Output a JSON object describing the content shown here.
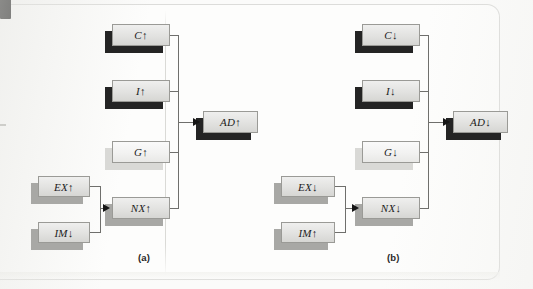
{
  "figure": {
    "type": "flow-diagram",
    "panels": [
      {
        "id": "a",
        "caption": "(a)",
        "component_nodes": [
          {
            "id": "c-up",
            "label": "C↑",
            "shade": "dark"
          },
          {
            "id": "i-up",
            "label": "I↑",
            "shade": "dark"
          },
          {
            "id": "g-up",
            "label": "G↑",
            "shade": "light"
          },
          {
            "id": "nx-up",
            "label": "NX↑",
            "shade": "mid"
          }
        ],
        "input_nodes": [
          {
            "id": "ex-up",
            "label": "EX↑",
            "shade": "mid"
          },
          {
            "id": "im-dn",
            "label": "IM↓",
            "shade": "mid"
          }
        ],
        "output_node": {
          "id": "ad-up",
          "label": "AD↑",
          "shade": "dark"
        }
      },
      {
        "id": "b",
        "caption": "(b)",
        "component_nodes": [
          {
            "id": "c-dn",
            "label": "C↓",
            "shade": "dark"
          },
          {
            "id": "i-dn",
            "label": "I↓",
            "shade": "dark"
          },
          {
            "id": "g-dn",
            "label": "G↓",
            "shade": "light"
          },
          {
            "id": "nx-dn",
            "label": "NX↓",
            "shade": "mid"
          }
        ],
        "input_nodes": [
          {
            "id": "ex-dn",
            "label": "EX↓",
            "shade": "mid"
          },
          {
            "id": "im-up",
            "label": "IM↑",
            "shade": "mid"
          }
        ],
        "output_node": {
          "id": "ad-dn",
          "label": "AD↓",
          "shade": "dark"
        }
      }
    ],
    "colors": {
      "paper": "#fdfdfc",
      "box_face": "#e6e6e4",
      "box_shadow_dark": "#242424",
      "box_shadow_mid": "#a8a8a5",
      "box_shadow_light": "#d9d9d6",
      "connector": "#6f6f6c",
      "text": "#1c1c1c"
    }
  }
}
